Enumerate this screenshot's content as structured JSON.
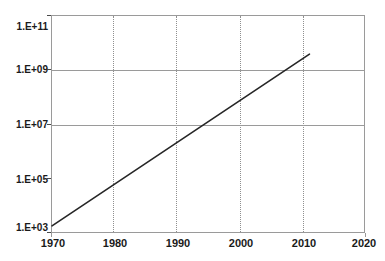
{
  "chart_data": {
    "type": "line",
    "title": "",
    "subtitle": "",
    "xlabel": "",
    "ylabel": "",
    "xlim": [
      1970,
      2020
    ],
    "ylim": [
      1000,
      100000000000
    ],
    "yscale": "log",
    "xscale": "linear",
    "grid": {
      "vertical": true,
      "vertical_style": "dotted",
      "horizontal": true,
      "horizontal_style": "solid",
      "horizontal_at": [
        "1.E+09",
        "1.E+07"
      ]
    },
    "legend": {
      "visible": false,
      "position": "none"
    },
    "x_ticks": [
      {
        "label": "1970",
        "value": 1970
      },
      {
        "label": "1980",
        "value": 1980
      },
      {
        "label": "1990",
        "value": 1990
      },
      {
        "label": "2000",
        "value": 2000
      },
      {
        "label": "2010",
        "value": 2010
      },
      {
        "label": "2020",
        "value": 2020
      }
    ],
    "y_ticks": [
      {
        "label": "1.E+11",
        "value": 100000000000
      },
      {
        "label": "1.E+09",
        "value": 1000000000
      },
      {
        "label": "1.E+07",
        "value": 10000000
      },
      {
        "label": "1.E+05",
        "value": 100000
      },
      {
        "label": "1.E+03",
        "value": 1000
      }
    ],
    "series": [
      {
        "name": "trend",
        "color": "#262626",
        "line_width": 1.6,
        "markers": false,
        "x": [
          1970,
          2011
        ],
        "values": [
          2000,
          4000000000
        ],
        "points": [
          {
            "x": 1970,
            "y": 2000
          },
          {
            "x": 2011,
            "y": 4000000000
          }
        ]
      }
    ],
    "annotations": []
  },
  "colors": {
    "background": "#ffffff",
    "axis": "#9a9a9a",
    "grid_dotted": "#8f8f8f",
    "grid_solid": "#9a9a9a",
    "series_line": "#262626",
    "tick_text": "#1a1a1a"
  }
}
